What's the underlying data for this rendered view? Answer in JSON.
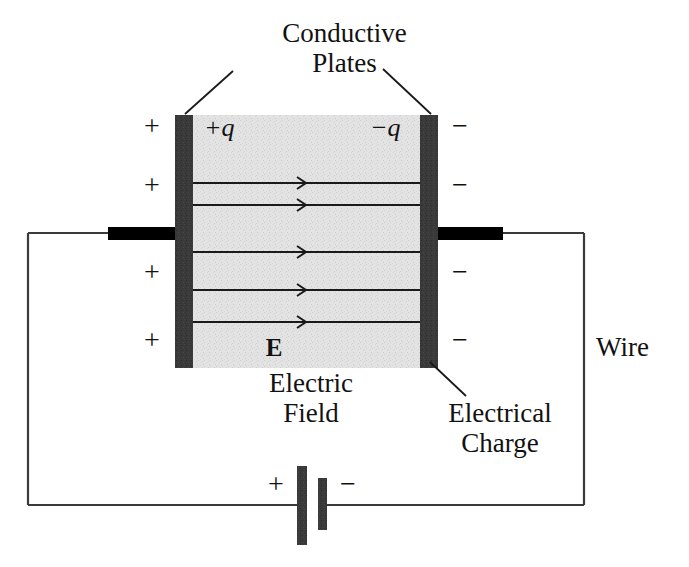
{
  "figure": {
    "title": "Conductive Plates",
    "width": 689,
    "height": 567,
    "background_color": "#ffffff"
  },
  "labels": {
    "conductive_plates": "Conductive\nPlates",
    "conductive_plates_line1": "Conductive",
    "conductive_plates_line2": "Plates",
    "wire": "Wire",
    "electric_field_line1": "Electric",
    "electric_field_line2": "Field",
    "electrical_charge_line1": "Electrical",
    "electrical_charge_line2": "Charge",
    "field_symbol": "E",
    "charge_positive": "+q",
    "charge_negative": "−q"
  },
  "plate_signs": {
    "positive": "+",
    "negative": "−",
    "left_positions_y": [
      126,
      185,
      272,
      340
    ],
    "right_positions_y": [
      126,
      185,
      272,
      340
    ],
    "left_count": 4,
    "right_count": 4
  },
  "battery": {
    "positive_sign": "+",
    "negative_sign": "−",
    "long_plate_color": "#3a3a3a",
    "short_plate_color": "#3a3a3a"
  },
  "geometry": {
    "left_plate": {
      "x": 175,
      "y": 115,
      "width": 18,
      "height": 253
    },
    "right_plate": {
      "x": 420,
      "y": 115,
      "width": 18,
      "height": 253
    },
    "dielectric": {
      "x": 193,
      "y": 115,
      "width": 227,
      "height": 253
    },
    "field_lines_y": [
      183,
      205,
      252,
      290,
      322
    ],
    "field_line_count": 5,
    "wire_loop": {
      "left_x": 28,
      "right_x": 584,
      "top_y": 233,
      "bottom_y": 505
    },
    "terminal_stub_left": {
      "x": 108,
      "y": 227,
      "width": 72,
      "height": 13
    },
    "terminal_stub_right": {
      "x": 436,
      "y": 227,
      "width": 67,
      "height": 13
    }
  },
  "colors": {
    "plate": "#3a3a3a",
    "dielectric": "#e0e0e0",
    "wire": "#3b3b3b",
    "terminal": "#000000",
    "field_line": "#1a1a1a",
    "text": "#111111"
  }
}
